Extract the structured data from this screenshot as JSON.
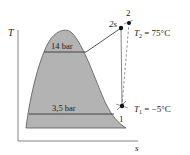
{
  "diagram": {
    "type": "T-s diagram (refrigeration cycle)",
    "axes": {
      "y_label": "T",
      "x_label": "s"
    },
    "pressure_lines": [
      {
        "id": "high",
        "label": "14 bar"
      },
      {
        "id": "low",
        "label": "3,5 bar"
      }
    ],
    "states": [
      {
        "id": "1",
        "label": "1",
        "temperature_label_var": "T",
        "temperature_label_sub": "1",
        "temperature_label_value": " = −5°C"
      },
      {
        "id": "2s",
        "label": "2s"
      },
      {
        "id": "2",
        "label": "2",
        "temperature_label_var": "T",
        "temperature_label_sub": "2",
        "temperature_label_value": " = 75°C"
      }
    ],
    "colors": {
      "dome_fill": "#b3b3b3",
      "line": "#555555",
      "axis": "#666666",
      "point": "#111111"
    }
  }
}
